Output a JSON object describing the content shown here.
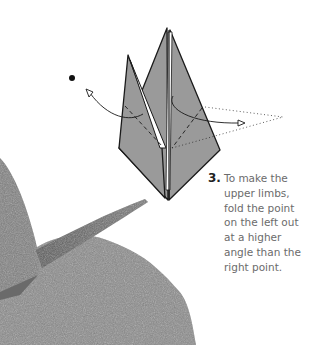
{
  "step": {
    "number": "3.",
    "lines": [
      "To make the",
      "upper limbs,",
      "fold the point",
      "on the left out",
      "at a higher",
      "angle than the",
      "right point."
    ]
  },
  "diagram": {
    "paper_color": "#9a9a9a",
    "line_color": "#1a1a1a",
    "background": "#ffffff"
  },
  "photo": {
    "subject": "grey origami model on textured mound",
    "tone": "greyscale"
  }
}
